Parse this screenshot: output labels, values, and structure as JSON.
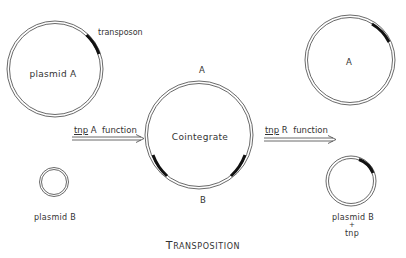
{
  "title": "Transposition",
  "labels": {
    "plasmid_a": "plasmid  A",
    "transposon": "transposon",
    "plasmid_b_left": "plasmid  B",
    "cointegrate": "Cointegrate",
    "cointegrate_top": "A",
    "cointegrate_bottom": "B",
    "arrow_left_tnp": "tnp",
    "arrow_left_rest": " A  function",
    "arrow_right_tnp": "tnp",
    "arrow_right_rest": " R  function",
    "result_a": "A",
    "result_plasmid_b": "plasmid  B",
    "result_plus": "+",
    "result_tnp": "tnp"
  },
  "colors": {
    "line": "#444444",
    "transposon": "#111111",
    "text": "#333333"
  }
}
